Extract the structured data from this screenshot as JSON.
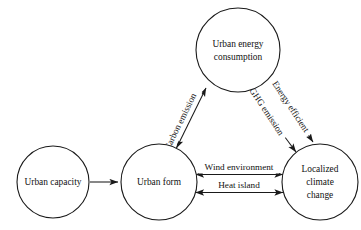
{
  "diagram": {
    "canvas": {
      "width": 361,
      "height": 230
    },
    "colors": {
      "background": "#ffffff",
      "stroke": "#1a1a1a",
      "node_fill": "#ffffff",
      "text": "#121212"
    },
    "nodes": [
      {
        "id": "urban-capacity",
        "label": "Urban capacity",
        "lines": [
          "Urban capacity"
        ],
        "cx": 53,
        "cy": 182,
        "r": 36
      },
      {
        "id": "urban-form",
        "label": "Urban form",
        "lines": [
          "Urban form"
        ],
        "cx": 159,
        "cy": 182,
        "r": 38
      },
      {
        "id": "urban-energy-consumption",
        "label": "Urban energy consumption",
        "lines": [
          "Urban energy",
          "consumption"
        ],
        "cx": 238,
        "cy": 50,
        "r": 42
      },
      {
        "id": "localized-climate-change",
        "label": "Localized climate change",
        "lines": [
          "Localized",
          "climate",
          "change"
        ],
        "cx": 320,
        "cy": 182,
        "r": 38
      }
    ],
    "edges": [
      {
        "id": "capacity-to-form",
        "from": "urban-capacity",
        "to": "urban-form",
        "label": "",
        "arrow": "single",
        "direction": "right"
      },
      {
        "id": "form-energy-carbon",
        "from": "urban-form",
        "to": "urban-energy-consumption",
        "label": "Carbon emission",
        "arrow": "double",
        "rotation": -61
      },
      {
        "id": "energy-climate-ghg",
        "from": "urban-energy-consumption",
        "to": "localized-climate-change",
        "label": "GHG emission",
        "arrow": "double",
        "rotation": 59
      },
      {
        "id": "energy-climate-efficiency",
        "from": "urban-energy-consumption",
        "to": "localized-climate-change",
        "label": "Energy efficient",
        "arrow": "double",
        "rotation": 59
      },
      {
        "id": "form-climate-wind",
        "from": "urban-form",
        "to": "localized-climate-change",
        "label": "Wind environment",
        "arrow": "double",
        "rotation": 0
      },
      {
        "id": "form-climate-heat",
        "from": "urban-form",
        "to": "localized-climate-change",
        "label": "Heat island",
        "arrow": "double",
        "rotation": 0
      }
    ]
  }
}
